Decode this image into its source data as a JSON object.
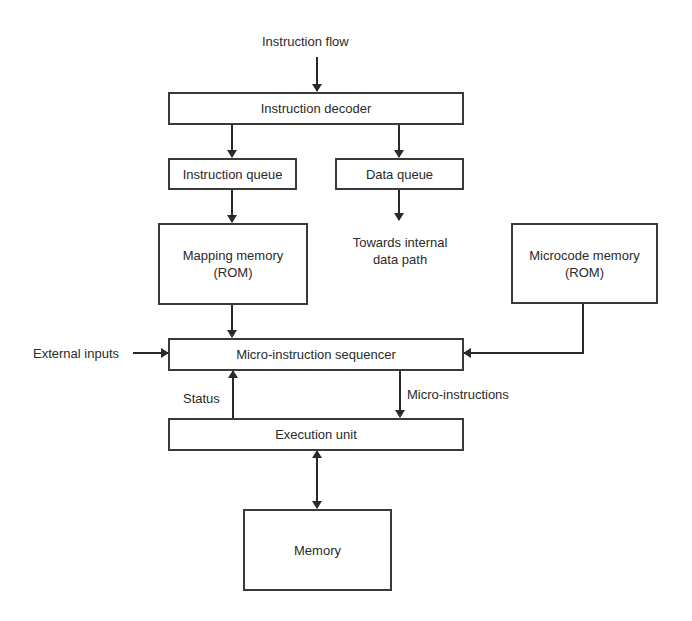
{
  "diagram": {
    "labels": {
      "instruction_flow": "Instruction flow",
      "towards_internal_line1": "Towards internal",
      "towards_internal_line2": "data path",
      "external_inputs": "External inputs",
      "status": "Status",
      "micro_instructions": "Micro-instructions"
    },
    "boxes": {
      "instruction_decoder": "Instruction decoder",
      "instruction_queue": "Instruction queue",
      "data_queue": "Data queue",
      "mapping_memory_line1": "Mapping memory",
      "mapping_memory_line2": "(ROM)",
      "microcode_memory_line1": "Microcode memory",
      "microcode_memory_line2": "(ROM)",
      "sequencer": "Micro-instruction sequencer",
      "execution_unit": "Execution unit",
      "memory": "Memory"
    },
    "colors": {
      "line": "#3a3a3a",
      "text": "#2a2a2a",
      "background": "#ffffff"
    }
  }
}
